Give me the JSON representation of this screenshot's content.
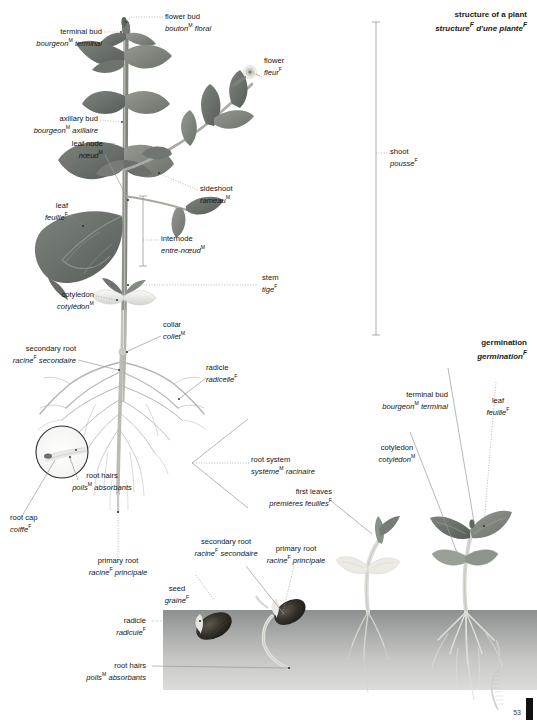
{
  "page": {
    "number": "53",
    "title": {
      "en": "structure of a plant",
      "fr": "structure",
      "fr_sup": "F",
      "fr_rest": " d'une plante",
      "fr_rest_sup": "F"
    }
  },
  "sections": [
    {
      "name": "germination",
      "en": "germination",
      "fr": "germination",
      "fr_sup": "F"
    }
  ],
  "labels": {
    "flower_bud": {
      "en": "flower bud",
      "fr_a": "bouton",
      "sup_a": "M",
      "fr_b": " floral",
      "sup_b": ""
    },
    "terminal_bud": {
      "en": "terminal bud",
      "fr_a": "bourgeon",
      "sup_a": "M",
      "fr_b": " terminal",
      "sup_b": ""
    },
    "flower": {
      "en": "flower",
      "fr_a": "fleur",
      "sup_a": "F",
      "fr_b": "",
      "sup_b": ""
    },
    "axillary_bud": {
      "en": "axillary bud",
      "fr_a": "bourgeon",
      "sup_a": "M",
      "fr_b": " axillaire",
      "sup_b": ""
    },
    "leaf_node": {
      "en": "leaf node",
      "fr_a": "nœud",
      "sup_a": "M",
      "fr_b": "",
      "sup_b": ""
    },
    "sideshoot": {
      "en": "sideshoot",
      "fr_a": "rameau",
      "sup_a": "M",
      "fr_b": "",
      "sup_b": ""
    },
    "shoot": {
      "en": "shoot",
      "fr_a": "pousse",
      "sup_a": "F",
      "fr_b": "",
      "sup_b": ""
    },
    "leaf": {
      "en": "leaf",
      "fr_a": "feuille",
      "sup_a": "F",
      "fr_b": "",
      "sup_b": ""
    },
    "internode": {
      "en": "internode",
      "fr_a": "entre-nœud",
      "sup_a": "M",
      "fr_b": "",
      "sup_b": ""
    },
    "stem": {
      "en": "stem",
      "fr_a": "tige",
      "sup_a": "F",
      "fr_b": "",
      "sup_b": ""
    },
    "cotyledon": {
      "en": "cotyledon",
      "fr_a": "cotylédon",
      "sup_a": "M",
      "fr_b": "",
      "sup_b": ""
    },
    "collar": {
      "en": "collar",
      "fr_a": "collet",
      "sup_a": "M",
      "fr_b": "",
      "sup_b": ""
    },
    "secondary_root": {
      "en": "secondary root",
      "fr_a": "racine",
      "sup_a": "F",
      "fr_b": " secondaire",
      "sup_b": ""
    },
    "radicle_fine": {
      "en": "radicle",
      "fr_a": "radicelle",
      "sup_a": "F",
      "fr_b": "",
      "sup_b": ""
    },
    "root_hairs": {
      "en": "root hairs",
      "fr_a": "poils",
      "sup_a": "M",
      "fr_b": " absorbants",
      "sup_b": ""
    },
    "root_system": {
      "en": "root system",
      "fr_a": "système",
      "sup_a": "M",
      "fr_b": " racinaire",
      "sup_b": ""
    },
    "root_cap": {
      "en": "root cap",
      "fr_a": "coiffe",
      "sup_a": "F",
      "fr_b": "",
      "sup_b": ""
    },
    "primary_root": {
      "en": "primary root",
      "fr_a": "racine",
      "sup_a": "F",
      "fr_b": " principale",
      "sup_b": ""
    },
    "first_leaves": {
      "en": "first leaves",
      "fr_a": "premières feuilles",
      "sup_a": "F",
      "fr_b": "",
      "sup_b": ""
    },
    "seed": {
      "en": "seed",
      "fr_a": "graine",
      "sup_a": "F",
      "fr_b": "",
      "sup_b": ""
    },
    "radicle_seed": {
      "en": "radicle",
      "fr_a": "radicule",
      "sup_a": "F",
      "fr_b": "",
      "sup_b": ""
    },
    "terminal_bud_g": {
      "en": "terminal bud",
      "fr_a": "bourgeon",
      "sup_a": "M",
      "fr_b": " terminal",
      "sup_b": ""
    },
    "leaf_g": {
      "en": "leaf",
      "fr_a": "feuille",
      "sup_a": "F",
      "fr_b": "",
      "sup_b": ""
    },
    "cotyledon_g": {
      "en": "cotyledon",
      "fr_a": "cotylédon",
      "sup_a": "M",
      "fr_b": "",
      "sup_b": ""
    },
    "secondary_root_s": {
      "en": "secondary root",
      "fr_a": "racine",
      "sup_a": "F",
      "fr_b": " secondaire",
      "sup_b": ""
    },
    "primary_root_s": {
      "en": "primary root",
      "fr_a": "racine",
      "sup_a": "F",
      "fr_b": " principale",
      "sup_b": ""
    },
    "root_hairs_s": {
      "en": "root hairs",
      "fr_a": "poils",
      "sup_a": "M",
      "fr_b": " absorbants",
      "sup_b": ""
    }
  },
  "colors": {
    "leaf_dark": "#6f7670",
    "leaf_mid": "#8b918a",
    "stem": "#a9aca4",
    "soil_top": "#8e9191",
    "soil_bottom": "#d8d9d7",
    "seed_dark": "#2e2b28",
    "line": "#9a9a9a",
    "text": "#141414"
  }
}
